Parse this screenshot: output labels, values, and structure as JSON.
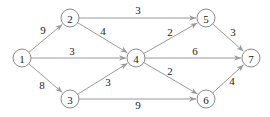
{
  "diagram": {
    "type": "directed-weighted-graph",
    "colors": {
      "edge": "#9a9a9a",
      "node_stroke": "#8a8a8a",
      "text": "#222222",
      "background": "#ffffff"
    },
    "nodes": [
      {
        "id": "1",
        "label": "1",
        "x": 22,
        "y": 58
      },
      {
        "id": "2",
        "label": "2",
        "x": 70,
        "y": 18
      },
      {
        "id": "3",
        "label": "3",
        "x": 70,
        "y": 99
      },
      {
        "id": "4",
        "label": "4",
        "x": 136,
        "y": 58
      },
      {
        "id": "5",
        "label": "5",
        "x": 206,
        "y": 18
      },
      {
        "id": "6",
        "label": "6",
        "x": 206,
        "y": 99
      },
      {
        "id": "7",
        "label": "7",
        "x": 251,
        "y": 58
      }
    ],
    "edges": [
      {
        "from": "1",
        "to": "2",
        "weight": "9",
        "lx": 43,
        "ly": 34
      },
      {
        "from": "1",
        "to": "4",
        "weight": "3",
        "lx": 72,
        "ly": 55
      },
      {
        "from": "1",
        "to": "3",
        "weight": "8",
        "lx": 42,
        "ly": 89
      },
      {
        "from": "2",
        "to": "5",
        "weight": "3",
        "lx": 138,
        "ly": 14
      },
      {
        "from": "2",
        "to": "4",
        "weight": "4",
        "lx": 103,
        "ly": 35
      },
      {
        "from": "3",
        "to": "4",
        "weight": "3",
        "lx": 108,
        "ly": 86
      },
      {
        "from": "3",
        "to": "6",
        "weight": "9",
        "lx": 138,
        "ly": 109
      },
      {
        "from": "4",
        "to": "5",
        "weight": "2",
        "lx": 170,
        "ly": 36
      },
      {
        "from": "4",
        "to": "7",
        "weight": "6",
        "lx": 195,
        "ly": 55
      },
      {
        "from": "4",
        "to": "6",
        "weight": "2",
        "lx": 170,
        "ly": 75
      },
      {
        "from": "5",
        "to": "7",
        "weight": "3",
        "lx": 233,
        "ly": 36
      },
      {
        "from": "6",
        "to": "7",
        "weight": "4",
        "lx": 232,
        "ly": 85
      }
    ]
  }
}
